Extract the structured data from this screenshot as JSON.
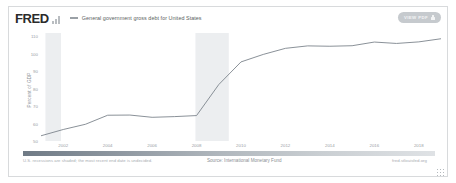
{
  "header": {
    "logo_text": "FRED",
    "logo_icon": "bar-chart-icon",
    "series_label": "General government gross debt for United States",
    "pdf_button_label": "VIEW PDF",
    "pdf_button_icon": "lock-icon"
  },
  "footer": {
    "recession_note": "U.S. recessions are shaded; the most recent end date is undecided.",
    "source": "Source: International Monetary Fund",
    "url": "fred.stlouisfed.org",
    "resize_icon": "resize-grip-icon"
  },
  "colors": {
    "line": "#7d858c",
    "recession_shade": "#eceef0",
    "axis_text": "#9aa0a6",
    "frame": "#d8dadc",
    "button": "#c6cace"
  },
  "chart_data": {
    "type": "line",
    "title": "General government gross debt for United States",
    "xlabel": "",
    "ylabel": "Percent of GDP",
    "xlim": [
      2001,
      2019
    ],
    "ylim": [
      50,
      112
    ],
    "grid": false,
    "legend_position": "top-left",
    "y_ticks": [
      110,
      100,
      90,
      80,
      70,
      60,
      50
    ],
    "x_ticks": [
      2002,
      2004,
      2006,
      2008,
      2010,
      2012,
      2014,
      2016,
      2018
    ],
    "series": [
      {
        "name": "General government gross debt for United States",
        "color": "#7d858c",
        "x": [
          2001,
          2002,
          2003,
          2004,
          2005,
          2006,
          2007,
          2008,
          2009,
          2010,
          2011,
          2012,
          2013,
          2014,
          2015,
          2016,
          2017,
          2018,
          2019
        ],
        "values": [
          53.0,
          56.6,
          59.6,
          64.8,
          64.9,
          63.6,
          64.0,
          64.6,
          82.4,
          95.4,
          99.7,
          103.2,
          104.6,
          104.4,
          104.7,
          106.8,
          106.0,
          106.9,
          108.7
        ]
      }
    ],
    "recession_bands": [
      {
        "start": 2001.2,
        "end": 2001.9
      },
      {
        "start": 2007.95,
        "end": 2009.45
      }
    ]
  }
}
